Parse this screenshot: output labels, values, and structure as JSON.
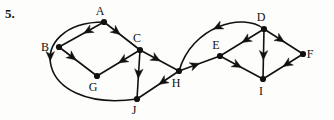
{
  "figure": {
    "problem_number": "5.",
    "type": "directed-graph",
    "width": 334,
    "height": 120,
    "background_color": "#fdfdfb",
    "ink_color": "#111111"
  },
  "nodes": [
    {
      "id": "A",
      "label": "A",
      "x": 104,
      "y": 22,
      "label_dx": -4,
      "label_dy": -7
    },
    {
      "id": "B",
      "label": "B",
      "x": 59,
      "y": 47,
      "label_dx": -14,
      "label_dy": 4
    },
    {
      "id": "C",
      "label": "C",
      "x": 140,
      "y": 50,
      "label_dx": -3,
      "label_dy": -8
    },
    {
      "id": "G",
      "label": "G",
      "x": 97,
      "y": 76,
      "label_dx": -4,
      "label_dy": 15
    },
    {
      "id": "J",
      "label": "J",
      "x": 137,
      "y": 99,
      "label_dx": -3,
      "label_dy": 15
    },
    {
      "id": "H",
      "label": "H",
      "x": 179,
      "y": 71,
      "label_dx": -3,
      "label_dy": 16
    },
    {
      "id": "E",
      "label": "E",
      "x": 220,
      "y": 56,
      "label_dx": -4,
      "label_dy": -7
    },
    {
      "id": "D",
      "label": "D",
      "x": 264,
      "y": 29,
      "label_dx": -3,
      "label_dy": -8
    },
    {
      "id": "I",
      "label": "I",
      "x": 263,
      "y": 79,
      "label_dx": -2,
      "label_dy": 16
    },
    {
      "id": "F",
      "label": "F",
      "x": 303,
      "y": 54,
      "label_dx": 7,
      "label_dy": 4
    }
  ],
  "edges": [
    {
      "from": "A",
      "to": "B",
      "shape": "straight",
      "arrow_pos": 0.45
    },
    {
      "from": "A",
      "to": "C",
      "shape": "straight",
      "arrow_pos": 0.45
    },
    {
      "from": "B",
      "to": "G",
      "shape": "straight",
      "arrow_pos": 0.45
    },
    {
      "from": "C",
      "to": "G",
      "shape": "straight",
      "arrow_pos": 0.5
    },
    {
      "from": "C",
      "to": "J",
      "shape": "straight",
      "arrow_pos": 0.58
    },
    {
      "from": "C",
      "to": "H",
      "shape": "straight",
      "arrow_pos": 0.52
    },
    {
      "from": "A",
      "to": "J",
      "shape": "curve-left",
      "cx1": 23,
      "cy1": 22,
      "cx2": 33,
      "cy2": 114,
      "arrow_pos": 0.46
    },
    {
      "from": "H",
      "to": "J",
      "shape": "straight",
      "arrow_pos": 0.48
    },
    {
      "from": "H",
      "to": "E",
      "shape": "straight",
      "arrow_pos": 0.5
    },
    {
      "from": "D",
      "to": "H",
      "shape": "curve-up",
      "cx1": 243,
      "cy1": 12,
      "cx2": 192,
      "cy2": 26,
      "arrow_pos": 0.55
    },
    {
      "from": "D",
      "to": "E",
      "shape": "straight",
      "arrow_pos": 0.5
    },
    {
      "from": "D",
      "to": "I",
      "shape": "straight",
      "arrow_pos": 0.62
    },
    {
      "from": "D",
      "to": "F",
      "shape": "straight",
      "arrow_pos": 0.52
    },
    {
      "from": "E",
      "to": "I",
      "shape": "straight",
      "arrow_pos": 0.5
    },
    {
      "from": "F",
      "to": "I",
      "shape": "straight",
      "arrow_pos": 0.5
    }
  ]
}
